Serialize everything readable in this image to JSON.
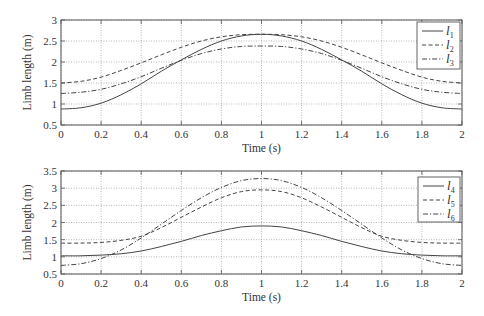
{
  "chart_data": [
    {
      "type": "line",
      "title": "",
      "xlabel": "Time (s)",
      "ylabel": "Limb length (m)",
      "xlim": [
        0,
        2
      ],
      "ylim": [
        0.5,
        3
      ],
      "xticks": [
        "0",
        "0.2",
        "0.4",
        "0.6",
        "0.8",
        "1",
        "1.2",
        "1.4",
        "1.6",
        "1.8",
        "2"
      ],
      "yticks": [
        "0.5",
        "1",
        "1.5",
        "2",
        "2.5",
        "3"
      ],
      "grid": true,
      "legend_position": "upper right",
      "x": [
        0,
        0.1,
        0.2,
        0.3,
        0.4,
        0.5,
        0.6,
        0.7,
        0.8,
        0.9,
        1.0,
        1.1,
        1.2,
        1.3,
        1.4,
        1.5,
        1.6,
        1.7,
        1.8,
        1.9,
        2.0
      ],
      "series": [
        {
          "name": "l1",
          "label_base": "l",
          "label_sub": "1",
          "style": "solid",
          "values": [
            0.88,
            0.91,
            1.02,
            1.22,
            1.48,
            1.78,
            2.05,
            2.3,
            2.5,
            2.62,
            2.66,
            2.62,
            2.5,
            2.3,
            2.05,
            1.78,
            1.48,
            1.22,
            1.02,
            0.91,
            0.88
          ]
        },
        {
          "name": "l2",
          "label_base": "l",
          "label_sub": "2",
          "style": "dashed",
          "values": [
            1.5,
            1.54,
            1.64,
            1.8,
            1.98,
            2.17,
            2.35,
            2.5,
            2.6,
            2.65,
            2.66,
            2.65,
            2.6,
            2.5,
            2.35,
            2.17,
            1.98,
            1.8,
            1.64,
            1.54,
            1.5
          ]
        },
        {
          "name": "l3",
          "label_base": "l",
          "label_sub": "3",
          "style": "dashdot",
          "values": [
            1.25,
            1.28,
            1.35,
            1.48,
            1.65,
            1.85,
            2.04,
            2.2,
            2.31,
            2.37,
            2.38,
            2.37,
            2.31,
            2.2,
            2.04,
            1.85,
            1.65,
            1.48,
            1.35,
            1.28,
            1.25
          ]
        }
      ]
    },
    {
      "type": "line",
      "title": "",
      "xlabel": "Time (s)",
      "ylabel": "Limb length (m)",
      "xlim": [
        0,
        2
      ],
      "ylim": [
        0.5,
        3.5
      ],
      "xticks": [
        "0",
        "0.2",
        "0.4",
        "0.6",
        "0.8",
        "1",
        "1.2",
        "1.4",
        "1.6",
        "1.8",
        "2"
      ],
      "yticks": [
        "0.5",
        "1",
        "1.5",
        "2",
        "2.5",
        "3",
        "3.5"
      ],
      "grid": true,
      "legend_position": "upper right",
      "x": [
        0,
        0.1,
        0.2,
        0.3,
        0.4,
        0.5,
        0.6,
        0.7,
        0.8,
        0.9,
        1.0,
        1.1,
        1.2,
        1.3,
        1.4,
        1.5,
        1.6,
        1.7,
        1.8,
        1.9,
        2.0
      ],
      "series": [
        {
          "name": "l4",
          "label_base": "l",
          "label_sub": "4",
          "style": "solid",
          "values": [
            1.03,
            1.03,
            1.05,
            1.09,
            1.17,
            1.3,
            1.45,
            1.62,
            1.76,
            1.87,
            1.9,
            1.87,
            1.76,
            1.62,
            1.45,
            1.3,
            1.17,
            1.09,
            1.05,
            1.03,
            1.03
          ]
        },
        {
          "name": "l5",
          "label_base": "l",
          "label_sub": "5",
          "style": "dashed",
          "values": [
            1.4,
            1.4,
            1.42,
            1.48,
            1.6,
            1.85,
            2.15,
            2.45,
            2.72,
            2.9,
            2.95,
            2.9,
            2.72,
            2.45,
            2.15,
            1.85,
            1.6,
            1.48,
            1.42,
            1.4,
            1.4
          ]
        },
        {
          "name": "l6",
          "label_base": "l",
          "label_sub": "6",
          "style": "dashdot",
          "values": [
            0.75,
            0.8,
            0.95,
            1.2,
            1.55,
            1.95,
            2.35,
            2.72,
            3.02,
            3.22,
            3.28,
            3.22,
            3.02,
            2.72,
            2.35,
            1.95,
            1.55,
            1.2,
            0.95,
            0.8,
            0.75
          ]
        }
      ]
    }
  ],
  "colors": {
    "line": "#444444",
    "axis": "#555555",
    "grid": "#9a9a9a",
    "text": "#333333"
  }
}
